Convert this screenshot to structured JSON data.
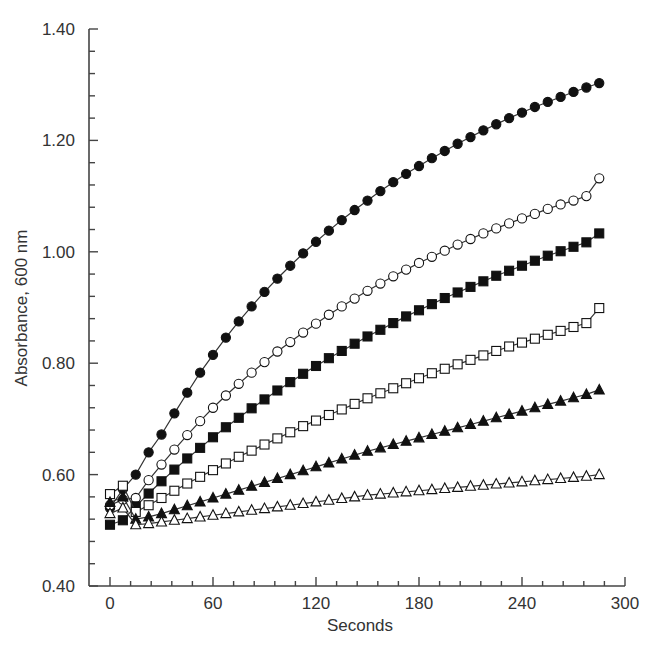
{
  "chart_data": {
    "type": "line",
    "title": "",
    "xlabel": "Seconds",
    "ylabel": "Absorbance, 600 nm",
    "xlim": [
      0,
      300
    ],
    "ylim": [
      0.4,
      1.4
    ],
    "x_ticks": [
      0,
      60,
      120,
      180,
      240,
      300
    ],
    "x_tick_labels": [
      "0",
      "60",
      "120",
      "180",
      "240",
      "300"
    ],
    "x_minor_step": 12,
    "y_ticks": [
      0.4,
      0.6,
      0.8,
      1.0,
      1.2,
      1.4
    ],
    "y_tick_labels": [
      "0.40",
      "0.60",
      "0.80",
      "1.00",
      "1.20",
      "1.40"
    ],
    "y_minor_step": 0.04,
    "grid": false,
    "legend": "none",
    "x": [
      0,
      7.5,
      15,
      22.5,
      30,
      37.5,
      45,
      52.5,
      60,
      67.5,
      75,
      82.5,
      90,
      97.5,
      105,
      112.5,
      120,
      127.5,
      135,
      142.5,
      150,
      157.5,
      165,
      172.5,
      180,
      187.5,
      195,
      202.5,
      210,
      217.5,
      225,
      232.5,
      240,
      247.5,
      255,
      262.5,
      270,
      277.5,
      285
    ],
    "series": [
      {
        "name": "filled circle",
        "marker": "circle-filled",
        "values": [
          0.54,
          0.574,
          0.6,
          0.64,
          0.672,
          0.71,
          0.747,
          0.783,
          0.815,
          0.846,
          0.875,
          0.902,
          0.928,
          0.952,
          0.975,
          0.997,
          1.018,
          1.038,
          1.057,
          1.075,
          1.092,
          1.109,
          1.125,
          1.14,
          1.154,
          1.168,
          1.181,
          1.194,
          1.206,
          1.218,
          1.229,
          1.24,
          1.25,
          1.26,
          1.269,
          1.278,
          1.287,
          1.295,
          1.303
        ]
      },
      {
        "name": "open circle",
        "marker": "circle-open",
        "values": [
          0.545,
          0.555,
          0.558,
          0.59,
          0.618,
          0.645,
          0.671,
          0.696,
          0.72,
          0.742,
          0.763,
          0.783,
          0.802,
          0.821,
          0.838,
          0.855,
          0.871,
          0.887,
          0.902,
          0.916,
          0.93,
          0.943,
          0.956,
          0.968,
          0.98,
          0.991,
          1.002,
          1.013,
          1.023,
          1.033,
          1.042,
          1.051,
          1.06,
          1.068,
          1.077,
          1.085,
          1.092,
          1.1,
          1.132
        ]
      },
      {
        "name": "filled square",
        "marker": "square-filled",
        "values": [
          0.51,
          0.518,
          0.543,
          0.566,
          0.588,
          0.609,
          0.629,
          0.648,
          0.667,
          0.685,
          0.702,
          0.719,
          0.735,
          0.751,
          0.766,
          0.781,
          0.795,
          0.809,
          0.822,
          0.835,
          0.848,
          0.86,
          0.872,
          0.884,
          0.895,
          0.906,
          0.917,
          0.927,
          0.937,
          0.947,
          0.957,
          0.966,
          0.975,
          0.984,
          0.993,
          1.001,
          1.009,
          1.017,
          1.033
        ]
      },
      {
        "name": "open square",
        "marker": "square-open",
        "values": [
          0.565,
          0.58,
          0.533,
          0.545,
          0.558,
          0.571,
          0.584,
          0.596,
          0.608,
          0.62,
          0.632,
          0.643,
          0.654,
          0.665,
          0.676,
          0.687,
          0.697,
          0.707,
          0.717,
          0.727,
          0.737,
          0.746,
          0.755,
          0.764,
          0.773,
          0.782,
          0.79,
          0.798,
          0.806,
          0.814,
          0.822,
          0.83,
          0.837,
          0.844,
          0.851,
          0.858,
          0.865,
          0.872,
          0.899
        ]
      },
      {
        "name": "filled triangle",
        "marker": "triangle-filled",
        "values": [
          0.55,
          0.56,
          0.52,
          0.524,
          0.53,
          0.537,
          0.544,
          0.551,
          0.558,
          0.565,
          0.572,
          0.579,
          0.586,
          0.593,
          0.6,
          0.607,
          0.614,
          0.621,
          0.628,
          0.635,
          0.642,
          0.648,
          0.654,
          0.66,
          0.666,
          0.672,
          0.678,
          0.684,
          0.69,
          0.696,
          0.702,
          0.708,
          0.714,
          0.72,
          0.726,
          0.732,
          0.738,
          0.744,
          0.752
        ]
      },
      {
        "name": "open triangle",
        "marker": "triangle-open",
        "values": [
          0.53,
          0.54,
          0.51,
          0.512,
          0.515,
          0.518,
          0.521,
          0.524,
          0.527,
          0.53,
          0.533,
          0.536,
          0.539,
          0.542,
          0.545,
          0.548,
          0.551,
          0.554,
          0.557,
          0.56,
          0.563,
          0.565,
          0.567,
          0.569,
          0.571,
          0.573,
          0.575,
          0.577,
          0.579,
          0.581,
          0.583,
          0.585,
          0.587,
          0.589,
          0.591,
          0.593,
          0.595,
          0.597,
          0.6
        ]
      }
    ]
  },
  "colors": {
    "axis": "#444444",
    "line": "#333333",
    "marker_fill": "#111111",
    "background": "#ffffff"
  }
}
